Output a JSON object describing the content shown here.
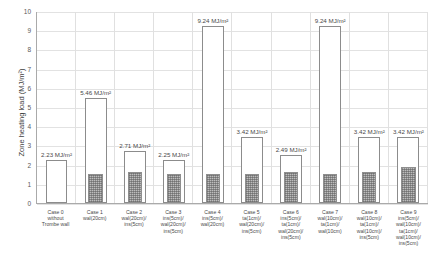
{
  "chart_data": {
    "type": "bar",
    "title": "",
    "xlabel": "",
    "ylabel": "Zone heating load (MJ/m²)",
    "ylim": [
      0,
      10
    ],
    "yticks": [
      "0",
      "1",
      "2",
      "3",
      "4",
      "5",
      "6",
      "7",
      "8",
      "9",
      "10"
    ],
    "grid": true,
    "legend": "none",
    "unit": "MJ/m²",
    "categories": [
      "Case 0 without Trombe wall",
      "Case 1 wal(20cm)",
      "Case 2 wal(20cm)/ins(5cm)",
      "Case 3 ins(5cm)/wal(20cm)/ins(5cm)",
      "Case 4 ins(5cm)/wal(20cm)",
      "Case 5 ta(1cm)/wal(20cm)/ins(5cm)",
      "Case 6 ins(5cm)/ta(1cm)/wal(20cm)/ins(5cm)",
      "Case 7 wal(10cm)/ta(1cm)/wal(10cm)",
      "Case 8 wal(10cm)/ta(1cm)/wal(10cm)/ins(5cm)",
      "Case 9 ins(5cm)/wal(10cm)/ta(1cm)/wal(10cm)/ins(5cm)"
    ],
    "category_lines": [
      [
        "Case 0",
        "without",
        "Trombe wall"
      ],
      [
        "Case 1",
        "wal(20cm)"
      ],
      [
        "Case 2",
        "wal(20cm)/",
        "ins(5cm)"
      ],
      [
        "Case 3",
        "ins(5cm)/",
        "wal(20cm)/",
        "ins(5cm)"
      ],
      [
        "Case 4",
        "ins(5cm)/",
        "wal(20cm)"
      ],
      [
        "Case 5",
        "ta(1cm)/",
        "wal(20cm)/",
        "ins(5cm)"
      ],
      [
        "Case 6",
        "ins(5cm)/",
        "ta(1cm)/",
        "wal(20cm)/",
        "ins(5cm)"
      ],
      [
        "Case 7",
        "wal(10cm)/",
        "ta(1cm)/",
        "wal(10cm)"
      ],
      [
        "Case 8",
        "wal(10cm)/",
        "ta(1cm)/",
        "wal(10cm)/",
        "ins(5cm)"
      ],
      [
        "Case 9",
        "ins(5cm)/",
        "wal(10cm)/",
        "ta(1cm)/",
        "wal(10cm)/",
        "ins(5cm)"
      ]
    ],
    "series": [
      {
        "name": "Zone heating load (outlined bar)",
        "style": "outline",
        "values": [
          2.23,
          5.46,
          2.71,
          2.25,
          9.24,
          3.42,
          2.49,
          9.24,
          3.42,
          3.42
        ]
      },
      {
        "name": "Inner hatched bar",
        "style": "hatched",
        "values": [
          0,
          1.52,
          1.6,
          1.52,
          1.52,
          1.52,
          1.6,
          1.52,
          1.6,
          1.86
        ]
      }
    ],
    "data_labels": [
      "2.23 MJ/m²",
      "5.46 MJ/m²",
      "2.71 MJ/m²",
      "2.25 MJ/m²",
      "9.24 MJ/m²",
      "3.42 MJ/m²",
      "2.49 MJ/m²",
      "9.24 MJ/m²",
      "3.42 MJ/m²",
      "3.42 MJ/m²"
    ],
    "colors": {
      "bar_outline": "#8c8c8c",
      "bar_fill": "#ffffff",
      "hatch_fill": "#bdbdbd",
      "grid": "#e2e2e2",
      "axis": "#aaaaaa",
      "text": "#4a4a4a"
    }
  }
}
